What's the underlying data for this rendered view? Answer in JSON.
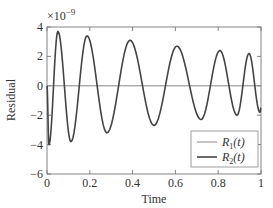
{
  "chart_data": {
    "type": "line",
    "title": "",
    "xlabel": "Time",
    "ylabel": "Residual",
    "y_multiplier_label": "×10^-9",
    "xlim": [
      0,
      1
    ],
    "ylim": [
      -6,
      4
    ],
    "xticks": [
      0,
      0.2,
      0.4,
      0.6,
      0.8,
      1
    ],
    "xtick_labels": [
      "0",
      "0.2",
      "0.4",
      "0.6",
      "0.8",
      "1"
    ],
    "yticks": [
      -6,
      -4,
      -2,
      0,
      2,
      4
    ],
    "ytick_labels": [
      "−6",
      "−4",
      "−2",
      "0",
      "2",
      "4"
    ],
    "grid": false,
    "legend_position": "lower right",
    "series": [
      {
        "name": "R1(t)",
        "label_main": "R",
        "label_sub": "1",
        "label_tail": "(t)",
        "color": "#888888",
        "line_width": 1,
        "x": [
          0,
          1
        ],
        "y": [
          0,
          0
        ]
      },
      {
        "name": "R2(t)",
        "label_main": "R",
        "label_sub": "2",
        "label_tail": "(t)",
        "color": "#444444",
        "line_width": 1.6,
        "extrema": [
          [
            0.0,
            0.0
          ],
          [
            0.009,
            -4.0
          ],
          [
            0.051,
            3.7
          ],
          [
            0.112,
            -3.8
          ],
          [
            0.187,
            3.4
          ],
          [
            0.28,
            -3.2
          ],
          [
            0.388,
            3.1
          ],
          [
            0.5,
            -2.7
          ],
          [
            0.607,
            2.7
          ],
          [
            0.72,
            -2.3
          ],
          [
            0.808,
            2.4
          ],
          [
            0.888,
            -2.0
          ],
          [
            0.944,
            2.2
          ],
          [
            0.995,
            -1.8
          ],
          [
            1.0,
            -1.5
          ]
        ]
      }
    ]
  }
}
